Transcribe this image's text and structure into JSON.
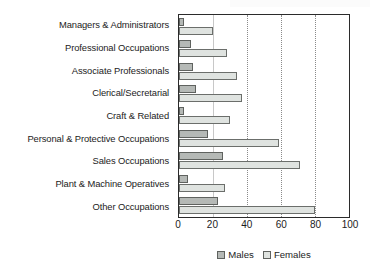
{
  "chart_data": {
    "type": "bar",
    "orientation": "horizontal",
    "title": "",
    "xlabel": "",
    "ylabel": "",
    "xlim": [
      0,
      100
    ],
    "grid": true,
    "legend_position": "bottom-center",
    "categories": [
      "Managers & Administrators",
      "Professional Occupations",
      "Associate Professionals",
      "Clerical/Secretarial",
      "Craft & Related",
      "Personal & Protective Occupations",
      "Sales Occupations",
      "Plant & Machine Operatives",
      "Other Occupations"
    ],
    "tick_labels": [
      "0",
      "20",
      "40",
      "60",
      "80",
      "100"
    ],
    "tick_values": [
      0,
      20,
      40,
      60,
      80,
      100
    ],
    "series": [
      {
        "name": "Males",
        "color": "#b5b9b6",
        "values": [
          3,
          7,
          8,
          10,
          3,
          17,
          26,
          5,
          23
        ]
      },
      {
        "name": "Females",
        "color": "#dfe3e0",
        "values": [
          20,
          28,
          34,
          37,
          30,
          59,
          71,
          27,
          80
        ]
      }
    ]
  },
  "legend": {
    "items": [
      {
        "label": "Males",
        "swatch": "males-swatch"
      },
      {
        "label": "Females",
        "swatch": "females-swatch"
      }
    ]
  }
}
